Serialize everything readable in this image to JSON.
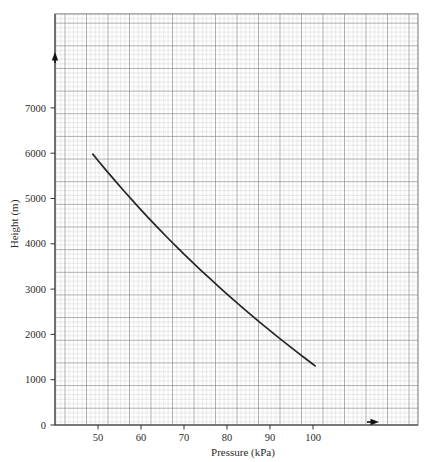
{
  "chart_data": {
    "type": "line",
    "title": "",
    "subtitle": "",
    "xlabel": "Pressure (kPa)",
    "ylabel": "Height (m)",
    "xlim": [
      41.0,
      125.5
    ],
    "ylim": [
      0,
      9075
    ],
    "grid": "minor and major graph paper grid",
    "legend": "none",
    "x_ticks": [
      50,
      60,
      70,
      80,
      90,
      100
    ],
    "x_tick_labels": [
      "50",
      "60",
      "70",
      "80",
      "90",
      "100"
    ],
    "y_ticks": [
      0,
      1000,
      2000,
      3000,
      4000,
      5000,
      6000,
      7000
    ],
    "y_tick_labels": [
      "0",
      "1000",
      "2000",
      "3000",
      "4000",
      "5000",
      "6000",
      "7000"
    ],
    "series": [
      {
        "name": "Height vs Pressure",
        "color": "#262626",
        "x": [
          48.8,
          50.0,
          52.0,
          54.0,
          56.0,
          58.0,
          60.0,
          62.0,
          64.0,
          66.0,
          68.0,
          70.0,
          72.0,
          74.0,
          76.0,
          78.0,
          80.0,
          82.0,
          84.0,
          86.0,
          88.0,
          90.0,
          92.0,
          94.0,
          96.0,
          98.0,
          100.0,
          100.5
        ],
        "y": [
          5980,
          5840,
          5610,
          5390,
          5170,
          4960,
          4750,
          4545,
          4345,
          4150,
          3960,
          3770,
          3590,
          3410,
          3235,
          3060,
          2890,
          2725,
          2560,
          2400,
          2240,
          2085,
          1930,
          1780,
          1630,
          1485,
          1340,
          1305
        ]
      }
    ],
    "annotations": [
      {
        "name": "left-edge-arrow-marker",
        "x_px": 55,
        "y_px": 58,
        "direction": "up"
      },
      {
        "name": "bottom-edge-arrow-marker",
        "x_px": 374,
        "y_px": 422,
        "direction": "right"
      }
    ]
  },
  "axes": {
    "x_title": "Pressure (kPa)",
    "y_title": "Height (m)"
  },
  "ticks": {
    "x": [
      "50",
      "60",
      "70",
      "80",
      "90",
      "100"
    ],
    "y": [
      "0",
      "1000",
      "2000",
      "3000",
      "4000",
      "5000",
      "6000",
      "7000"
    ]
  },
  "colors": {
    "curve": "#262626",
    "grid_minor": "#b9b9b9",
    "grid_major": "#6e6e6e",
    "axis": "#333333",
    "text": "#2b2b2b",
    "background": "#ffffff"
  }
}
